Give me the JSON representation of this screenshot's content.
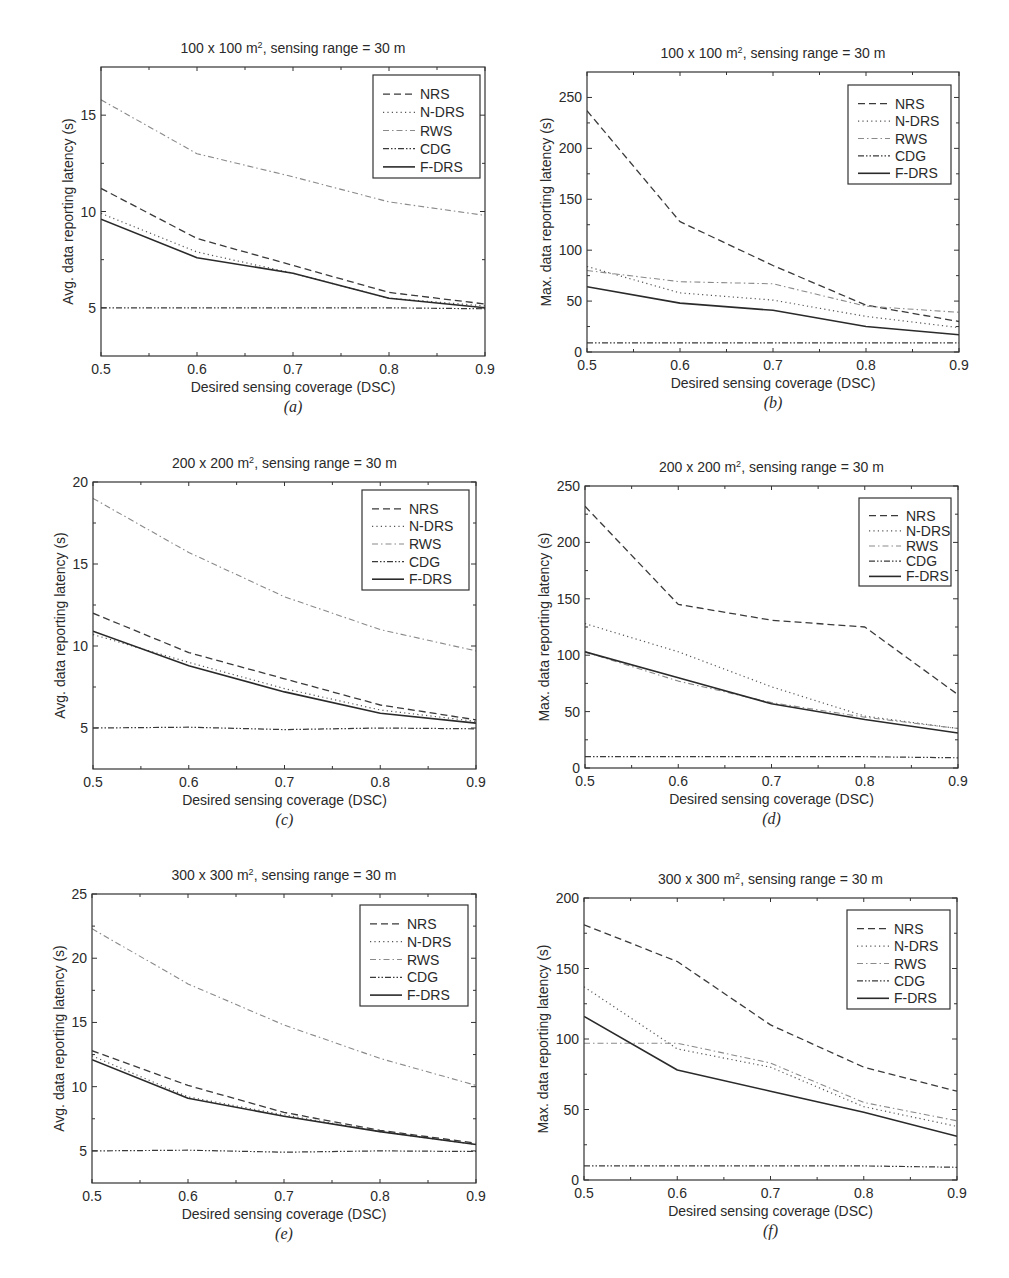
{
  "figure": {
    "legend_labels": [
      "NRS",
      "N-DRS",
      "RWS",
      "CDG",
      "F-DRS"
    ],
    "series_styles": {
      "NRS": {
        "dash": "7,4",
        "color": "#3a3a3a",
        "width": 1.3
      },
      "N-DRS": {
        "dash": "1.2,3.2",
        "color": "#555555",
        "width": 1.2
      },
      "RWS": {
        "dash": "6,3,1.5,3",
        "color": "#8a8a8a",
        "width": 1.1
      },
      "CDG": {
        "dash": "6,2,1.5,2,1.5,2",
        "color": "#3a3a3a",
        "width": 1.2
      },
      "F-DRS": {
        "dash": "",
        "color": "#2a2a2a",
        "width": 1.6
      }
    }
  },
  "chart_data": [
    {
      "id": "a",
      "type": "line",
      "caption": "(a)",
      "title": "100 x 100 m², sensing range = 30 m",
      "title_main": "100 x 100 m",
      "title_sup": "2",
      "title_rest": ", sensing range = 30 m",
      "xlabel": "Desired sensing coverage (DSC)",
      "ylabel": "Avg. data reporting latency (s)",
      "x": [
        0.5,
        0.6,
        0.7,
        0.8,
        0.9
      ],
      "xticks": [
        "0.5",
        "0.6",
        "0.7",
        "0.8",
        "0.9"
      ],
      "xlim": [
        0.5,
        0.9
      ],
      "ylim": [
        2.5,
        17.5
      ],
      "yticks": [
        5,
        10,
        15
      ],
      "yminor": [
        2.5,
        7.5,
        12.5,
        17.5
      ],
      "grid": false,
      "legend_position": "upper right",
      "series": [
        {
          "name": "NRS",
          "values": [
            11.2,
            8.6,
            7.2,
            5.8,
            5.2
          ]
        },
        {
          "name": "N-DRS",
          "values": [
            9.9,
            7.9,
            6.8,
            5.5,
            5.1
          ]
        },
        {
          "name": "RWS",
          "values": [
            15.8,
            13.0,
            11.8,
            10.5,
            9.8
          ]
        },
        {
          "name": "CDG",
          "values": [
            5.0,
            5.0,
            5.0,
            5.0,
            4.95
          ]
        },
        {
          "name": "F-DRS",
          "values": [
            9.6,
            7.6,
            6.8,
            5.5,
            5.0
          ]
        }
      ],
      "box": {
        "x": 101,
        "y": 67,
        "w": 384,
        "h": 289
      },
      "legend_box": {
        "x": 373,
        "y": 75,
        "w": 107,
        "h": 103
      }
    },
    {
      "id": "b",
      "type": "line",
      "caption": "(b)",
      "title": "100 x 100 m², sensing range = 30 m",
      "title_main": "100 x 100 m",
      "title_sup": "2",
      "title_rest": ", sensing range = 30 m",
      "xlabel": "Desired sensing coverage (DSC)",
      "ylabel": "Max. data reporting latency (s)",
      "x": [
        0.5,
        0.6,
        0.7,
        0.8,
        0.9
      ],
      "xticks": [
        "0.5",
        "0.6",
        "0.7",
        "0.8",
        "0.9"
      ],
      "xlim": [
        0.5,
        0.9
      ],
      "ylim": [
        0,
        275
      ],
      "yticks": [
        0,
        50,
        100,
        150,
        200,
        250
      ],
      "yminor": [
        25,
        75,
        125,
        175,
        225,
        275
      ],
      "grid": false,
      "legend_position": "upper right",
      "series": [
        {
          "name": "NRS",
          "values": [
            237,
            128,
            85,
            46,
            30
          ]
        },
        {
          "name": "N-DRS",
          "values": [
            84,
            58,
            51,
            35,
            24
          ]
        },
        {
          "name": "RWS",
          "values": [
            80,
            69,
            67,
            45,
            39
          ]
        },
        {
          "name": "CDG",
          "values": [
            9,
            9,
            9,
            9,
            9
          ]
        },
        {
          "name": "F-DRS",
          "values": [
            64,
            48,
            41,
            25,
            17
          ]
        }
      ],
      "box": {
        "x": 587,
        "y": 72,
        "w": 372,
        "h": 280
      },
      "legend_box": {
        "x": 848,
        "y": 85,
        "w": 103,
        "h": 99
      }
    },
    {
      "id": "c",
      "type": "line",
      "caption": "(c)",
      "title": "200 x 200 m², sensing range = 30 m",
      "title_main": "200 x 200 m",
      "title_sup": "2",
      "title_rest": ", sensing range = 30 m",
      "xlabel": "Desired sensing coverage (DSC)",
      "ylabel": "Avg. data reporting latency (s)",
      "x": [
        0.5,
        0.6,
        0.7,
        0.8,
        0.9
      ],
      "xticks": [
        "0.5",
        "0.6",
        "0.7",
        "0.8",
        "0.9"
      ],
      "xlim": [
        0.5,
        0.9
      ],
      "ylim": [
        2.5,
        20
      ],
      "yticks": [
        5,
        10,
        15,
        20
      ],
      "yminor": [
        7.5,
        12.5,
        17.5
      ],
      "grid": false,
      "legend_position": "upper right",
      "series": [
        {
          "name": "NRS",
          "values": [
            12.0,
            9.6,
            8.0,
            6.4,
            5.5
          ]
        },
        {
          "name": "N-DRS",
          "values": [
            10.7,
            9.0,
            7.4,
            6.1,
            5.4
          ]
        },
        {
          "name": "RWS",
          "values": [
            19.0,
            15.7,
            13.0,
            11.0,
            9.7
          ]
        },
        {
          "name": "CDG",
          "values": [
            5.0,
            5.05,
            4.9,
            5.0,
            4.95
          ]
        },
        {
          "name": "F-DRS",
          "values": [
            10.9,
            8.8,
            7.2,
            5.9,
            5.3
          ]
        }
      ],
      "box": {
        "x": 93,
        "y": 482,
        "w": 383,
        "h": 287
      },
      "legend_box": {
        "x": 362,
        "y": 490,
        "w": 107,
        "h": 100
      }
    },
    {
      "id": "d",
      "type": "line",
      "caption": "(d)",
      "title": "200 x 200 m², sensing range = 30 m",
      "title_main": "200 x 200 m",
      "title_sup": "2",
      "title_rest": ", sensing range = 30 m",
      "xlabel": "Desired sensing coverage (DSC)",
      "ylabel": "Max. data reporting latency (s)",
      "x": [
        0.5,
        0.6,
        0.7,
        0.8,
        0.9
      ],
      "xticks": [
        "0.5",
        "0.6",
        "0.7",
        "0.8",
        "0.9"
      ],
      "xlim": [
        0.5,
        0.9
      ],
      "ylim": [
        0,
        250
      ],
      "yticks": [
        0,
        50,
        100,
        150,
        200,
        250
      ],
      "yminor": [
        25,
        75,
        125,
        175,
        225
      ],
      "grid": false,
      "legend_position": "upper right",
      "series": [
        {
          "name": "NRS",
          "values": [
            232,
            145,
            131,
            125,
            65
          ]
        },
        {
          "name": "N-DRS",
          "values": [
            128,
            103,
            72,
            46,
            35
          ]
        },
        {
          "name": "RWS",
          "values": [
            103,
            77,
            58,
            45,
            35
          ]
        },
        {
          "name": "CDG",
          "values": [
            10,
            10,
            10,
            10,
            9
          ]
        },
        {
          "name": "F-DRS",
          "values": [
            103,
            80,
            57,
            43,
            31
          ]
        }
      ],
      "box": {
        "x": 585,
        "y": 486,
        "w": 373,
        "h": 282
      },
      "legend_box": {
        "x": 859,
        "y": 498,
        "w": 92,
        "h": 88
      }
    },
    {
      "id": "e",
      "type": "line",
      "caption": "(e)",
      "title": "300 x 300 m², sensing range = 30 m",
      "title_main": "300 x 300 m",
      "title_sup": "2",
      "title_rest": ", sensing range = 30 m",
      "xlabel": "Desired sensing coverage (DSC)",
      "ylabel": "Avg. data reporting latency (s)",
      "x": [
        0.5,
        0.6,
        0.7,
        0.8,
        0.9
      ],
      "xticks": [
        "0.5",
        "0.6",
        "0.7",
        "0.8",
        "0.9"
      ],
      "xlim": [
        0.5,
        0.9
      ],
      "ylim": [
        2.5,
        25
      ],
      "yticks": [
        5,
        10,
        15,
        20,
        25
      ],
      "yminor": [
        7.5,
        12.5,
        17.5,
        22.5
      ],
      "grid": false,
      "legend_position": "upper right",
      "series": [
        {
          "name": "NRS",
          "values": [
            12.8,
            10.1,
            8.0,
            6.6,
            5.6
          ]
        },
        {
          "name": "N-DRS",
          "values": [
            12.4,
            9.2,
            7.8,
            6.5,
            5.5
          ]
        },
        {
          "name": "RWS",
          "values": [
            22.3,
            18.0,
            14.8,
            12.2,
            10.1
          ]
        },
        {
          "name": "CDG",
          "values": [
            5.0,
            5.05,
            4.9,
            5.0,
            4.95
          ]
        },
        {
          "name": "F-DRS",
          "values": [
            12.1,
            9.1,
            7.7,
            6.5,
            5.5
          ]
        }
      ],
      "box": {
        "x": 92,
        "y": 894,
        "w": 384,
        "h": 289
      },
      "legend_box": {
        "x": 360,
        "y": 905,
        "w": 108,
        "h": 101
      }
    },
    {
      "id": "f",
      "type": "line",
      "caption": "(f)",
      "title": "300 x 300 m², sensing range = 30 m",
      "title_main": "300 x 300 m",
      "title_sup": "2",
      "title_rest": ", sensing range = 30 m",
      "xlabel": "Desired sensing coverage (DSC)",
      "ylabel": "Max. data reporting latency (s)",
      "x": [
        0.5,
        0.6,
        0.7,
        0.8,
        0.9
      ],
      "xticks": [
        "0.5",
        "0.6",
        "0.7",
        "0.8",
        "0.9"
      ],
      "xlim": [
        0.5,
        0.9
      ],
      "ylim": [
        0,
        200
      ],
      "yticks": [
        0,
        50,
        100,
        150,
        200
      ],
      "yminor": [
        25,
        75,
        125,
        175
      ],
      "grid": false,
      "legend_position": "upper right",
      "series": [
        {
          "name": "NRS",
          "values": [
            181,
            155,
            110,
            80,
            63
          ]
        },
        {
          "name": "N-DRS",
          "values": [
            137,
            93,
            80,
            52,
            38
          ]
        },
        {
          "name": "RWS",
          "values": [
            97,
            97,
            83,
            55,
            42
          ]
        },
        {
          "name": "CDG",
          "values": [
            10,
            10,
            10,
            10,
            9
          ]
        },
        {
          "name": "F-DRS",
          "values": [
            116,
            78,
            63,
            48,
            31
          ]
        }
      ],
      "box": {
        "x": 584,
        "y": 898,
        "w": 373,
        "h": 282
      },
      "legend_box": {
        "x": 847,
        "y": 910,
        "w": 103,
        "h": 99
      }
    }
  ]
}
